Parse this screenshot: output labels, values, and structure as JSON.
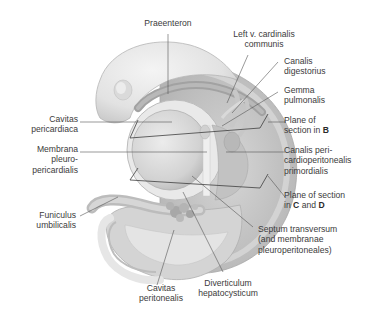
{
  "figure": {
    "labels": {
      "praeenteron": "Praeenteron",
      "left_v_cardinalis": [
        "Left v. cardinalis",
        "communis"
      ],
      "canalis_digestorius": [
        "Canalis",
        "digestorius"
      ],
      "gemma_pulmonalis": [
        "Gemma",
        "pulmonalis"
      ],
      "plane_b": {
        "line1": "Plane of",
        "line2_prefix": "section in ",
        "line2_bold": "B"
      },
      "cavitas_pericardiaca": [
        "Cavitas",
        "pericardiaca"
      ],
      "membrana_pleuro": [
        "Membrana",
        "pleuro-",
        "pericardialis"
      ],
      "canalis_peri": [
        "Canalis peri-",
        "cardioperitonealis",
        "primordialis"
      ],
      "plane_cd": {
        "line1": "Plane of section",
        "line2_prefix": "in ",
        "bold1": "C",
        "and": " and ",
        "bold2": "D"
      },
      "funiculus": [
        "Funiculus",
        "umbilicalis"
      ],
      "septum": [
        "Septum transversum",
        "(and membranae",
        "pleuroperitoneales)"
      ],
      "cavitas_peritonealis": [
        "Cavitas",
        "peritonealis"
      ],
      "diverticulum": [
        "Diverticulum",
        "hepatocysticum"
      ]
    },
    "colors": {
      "embryo_light": "#e8e8e8",
      "embryo_mid": "#cfcfcf",
      "embryo_dark": "#a9a9a9",
      "leader_line": "#555555",
      "text": "#3b3b3b"
    }
  }
}
